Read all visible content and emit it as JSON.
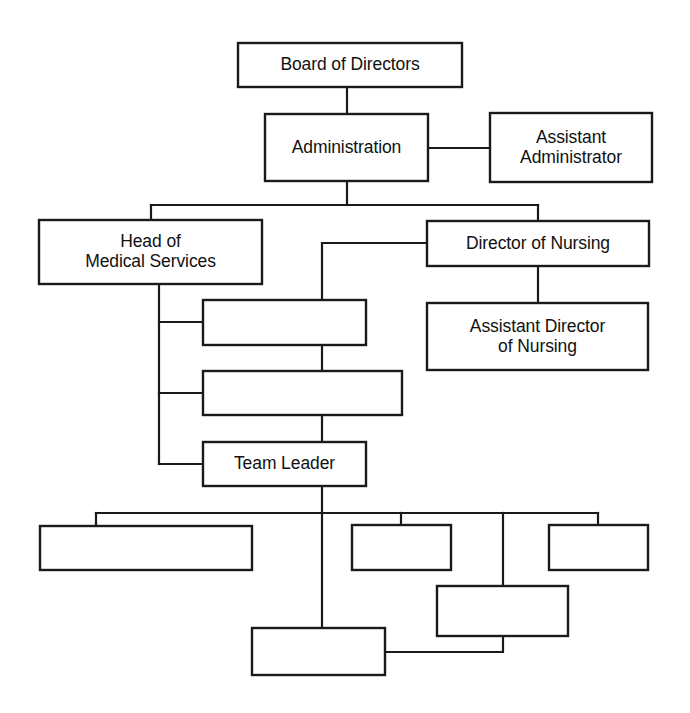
{
  "diagram": {
    "type": "org-chart",
    "orientation": "top-down",
    "background_color": "#ffffff",
    "line_color": "#1a1a1a",
    "box_fill": "#ffffff"
  },
  "nodes": [
    {
      "id": "board",
      "label": "Board of Directors",
      "x": 238,
      "y": 43,
      "w": 224,
      "h": 44
    },
    {
      "id": "admin",
      "label": "Administration",
      "x": 265,
      "y": 114,
      "w": 163,
      "h": 67
    },
    {
      "id": "asst-admin",
      "label": "Assistant\nAdministrator",
      "x": 490,
      "y": 113,
      "w": 162,
      "h": 69
    },
    {
      "id": "head-medical",
      "label": "Head of\nMedical Services",
      "x": 39,
      "y": 220,
      "w": 223,
      "h": 64
    },
    {
      "id": "dir-nursing",
      "label": "Director of Nursing",
      "x": 427,
      "y": 221,
      "w": 222,
      "h": 45
    },
    {
      "id": "asst-dir-nursing",
      "label": "Assistant Director\nof Nursing",
      "x": 427,
      "y": 303,
      "w": 221,
      "h": 67
    },
    {
      "id": "med-unit-1",
      "label": "",
      "x": 203,
      "y": 300,
      "w": 163,
      "h": 45
    },
    {
      "id": "med-unit-2",
      "label": "",
      "x": 203,
      "y": 371,
      "w": 199,
      "h": 44
    },
    {
      "id": "team-leader",
      "label": "Team Leader",
      "x": 203,
      "y": 442,
      "w": 163,
      "h": 44
    },
    {
      "id": "staff-1",
      "label": "",
      "x": 40,
      "y": 526,
      "w": 212,
      "h": 44
    },
    {
      "id": "staff-2",
      "label": "",
      "x": 352,
      "y": 525,
      "w": 99,
      "h": 45
    },
    {
      "id": "staff-3",
      "label": "",
      "x": 549,
      "y": 525,
      "w": 99,
      "h": 45
    },
    {
      "id": "staff-4",
      "label": "",
      "x": 437,
      "y": 586,
      "w": 131,
      "h": 50
    },
    {
      "id": "staff-5",
      "label": "",
      "x": 252,
      "y": 628,
      "w": 133,
      "h": 47
    }
  ],
  "connections": [
    {
      "from": "board",
      "to": "admin",
      "style": "vertical"
    },
    {
      "from": "admin",
      "to": "asst-admin",
      "style": "horizontal-staff"
    },
    {
      "from": "admin",
      "to": "head-medical",
      "style": "elbow-bus"
    },
    {
      "from": "admin",
      "to": "dir-nursing",
      "style": "elbow-bus"
    },
    {
      "from": "dir-nursing",
      "to": "asst-dir-nursing",
      "style": "vertical"
    },
    {
      "from": "head-medical",
      "to": "med-unit-1",
      "style": "left-spine"
    },
    {
      "from": "head-medical",
      "to": "med-unit-2",
      "style": "left-spine"
    },
    {
      "from": "head-medical",
      "to": "team-leader",
      "style": "left-spine"
    },
    {
      "from": "dir-nursing",
      "to": "med-unit-1",
      "style": "center-spine"
    },
    {
      "from": "med-unit-1",
      "to": "med-unit-2",
      "style": "vertical"
    },
    {
      "from": "med-unit-2",
      "to": "team-leader",
      "style": "vertical"
    },
    {
      "from": "team-leader",
      "to": "staff-1",
      "style": "elbow-bus"
    },
    {
      "from": "team-leader",
      "to": "staff-2",
      "style": "elbow-bus"
    },
    {
      "from": "team-leader",
      "to": "staff-3",
      "style": "elbow-bus"
    },
    {
      "from": "team-leader",
      "to": "staff-4",
      "style": "elbow-bus"
    },
    {
      "from": "team-leader",
      "to": "staff-5",
      "style": "center-spine"
    },
    {
      "from": "staff-4",
      "to": "staff-5",
      "style": "horizontal-staff"
    }
  ]
}
